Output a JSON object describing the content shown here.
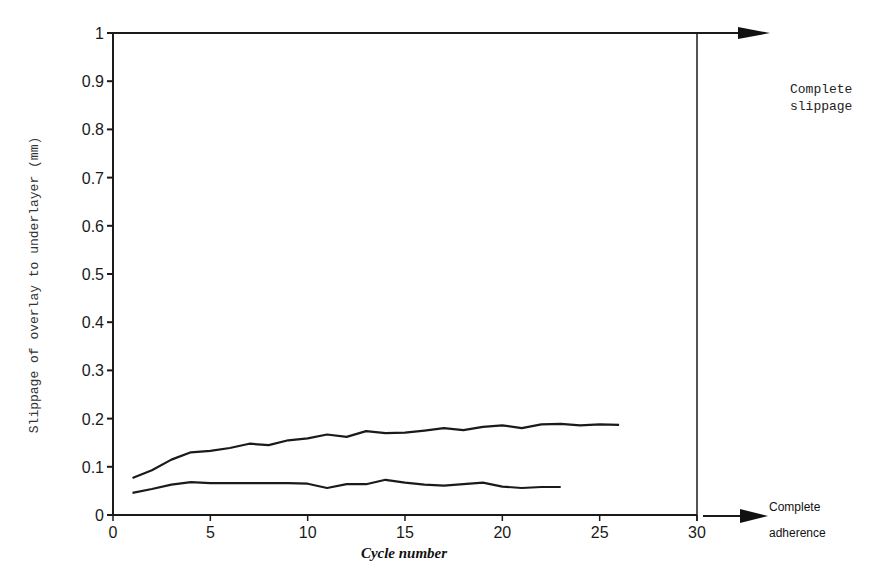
{
  "chart_data": {
    "type": "line",
    "title": "",
    "xlabel": "Cycle number",
    "ylabel": "Slippage of overlay to underlayer (mm)",
    "xlim": [
      0,
      30
    ],
    "ylim": [
      0,
      1
    ],
    "x_ticks": [
      "0",
      "5",
      "10",
      "15",
      "20",
      "25",
      "30"
    ],
    "y_ticks": [
      "0",
      "0.1",
      "0.2",
      "0.3",
      "0.4",
      "0.5",
      "0.6",
      "0.7",
      "0.8",
      "0.9",
      "1"
    ],
    "grid": false,
    "legend": null,
    "series": [
      {
        "name": "upper curve",
        "x": [
          1,
          2,
          3,
          4,
          5,
          6,
          7,
          8,
          9,
          10,
          11,
          12,
          13,
          14,
          15,
          16,
          17,
          18,
          19,
          20,
          21,
          22,
          23,
          24,
          25,
          26
        ],
        "values": [
          0.077,
          0.093,
          0.115,
          0.13,
          0.133,
          0.139,
          0.148,
          0.145,
          0.155,
          0.159,
          0.167,
          0.162,
          0.174,
          0.17,
          0.171,
          0.175,
          0.18,
          0.176,
          0.183,
          0.186,
          0.18,
          0.188,
          0.189,
          0.186,
          0.188,
          0.187
        ]
      },
      {
        "name": "lower curve",
        "x": [
          1,
          2,
          3,
          4,
          5,
          6,
          7,
          8,
          9,
          10,
          11,
          12,
          13,
          14,
          15,
          16,
          17,
          18,
          19,
          20,
          21,
          22,
          23
        ],
        "values": [
          0.046,
          0.054,
          0.063,
          0.068,
          0.066,
          0.066,
          0.066,
          0.066,
          0.066,
          0.065,
          0.056,
          0.064,
          0.064,
          0.073,
          0.067,
          0.063,
          0.061,
          0.064,
          0.067,
          0.059,
          0.056,
          0.058,
          0.058
        ]
      }
    ],
    "annotations": [
      {
        "text": "Complete slippage",
        "position": "top-right, arrow at y=1"
      },
      {
        "text": "Complete adherence",
        "position": "bottom-right, arrow at y=0"
      }
    ]
  },
  "labels": {
    "xlabel": "Cycle number",
    "ylabel": "Slippage of overlay to underlayer (mm)",
    "slippage_line1": "Complete",
    "slippage_line2": "slippage",
    "adherence_line1": "Complete",
    "adherence_line2": "adherence"
  },
  "colors": {
    "line": "#1a1a1a",
    "background": "#ffffff"
  }
}
